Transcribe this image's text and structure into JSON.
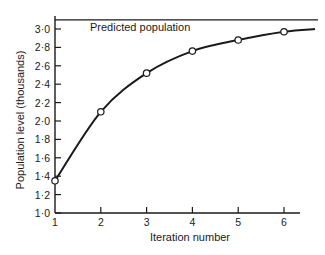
{
  "chart_data": {
    "type": "line",
    "title": "",
    "xlabel": "Iteration number",
    "ylabel": "Population level (thousands)",
    "x": [
      1,
      2,
      3,
      4,
      5,
      6
    ],
    "series": [
      {
        "name": "Population level",
        "values": [
          1.35,
          2.1,
          2.52,
          2.76,
          2.88,
          2.97
        ],
        "markers": "open-circle",
        "smooth": true
      }
    ],
    "reference_lines": [
      {
        "label": "Predicted population",
        "y": 3.1,
        "orientation": "horizontal"
      }
    ],
    "xticks": [
      "1",
      "2",
      "3",
      "4",
      "5",
      "6"
    ],
    "yticks": [
      "1·0",
      "1·2",
      "1·4",
      "1·6",
      "1·8",
      "2·0",
      "2·2",
      "2·4",
      "2·6",
      "2·8",
      "3·0"
    ],
    "xlim": [
      1,
      6.35
    ],
    "ylim": [
      1.0,
      3.14
    ],
    "grid": false,
    "legend": "none"
  },
  "labels": {
    "xlabel": "Iteration number",
    "ylabel": "Population level (thousands)",
    "predicted": "Predicted population"
  },
  "colors": {
    "ink": "#1a1a1a",
    "background": "#ffffff"
  }
}
